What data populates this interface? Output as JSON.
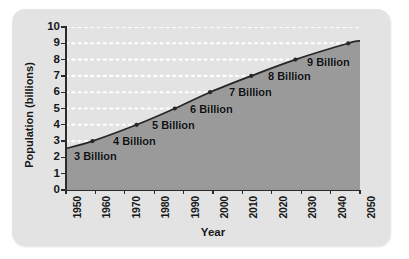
{
  "chart_data": {
    "type": "area",
    "title": "",
    "subtitle": "",
    "xlabel": "Year",
    "ylabel": "Population (billions)",
    "xlim": [
      1950,
      2050
    ],
    "ylim": [
      0,
      10
    ],
    "grid": "horizontal-dotted-white",
    "legend": "none",
    "x_tick_labels": [
      "1950",
      "1960",
      "1970",
      "1980",
      "1990",
      "2000",
      "2010",
      "2020",
      "2030",
      "2040",
      "2050"
    ],
    "x_ticks": [
      1950,
      1960,
      1970,
      1980,
      1990,
      2000,
      2010,
      2020,
      2030,
      2040,
      2050
    ],
    "y_tick_labels": [
      "0",
      "1",
      "2",
      "3",
      "4",
      "5",
      "6",
      "7",
      "8",
      "9",
      "10"
    ],
    "y_ticks": [
      0,
      1,
      2,
      3,
      4,
      5,
      6,
      7,
      8,
      9,
      10
    ],
    "series": [
      {
        "name": "World population",
        "x": [
          1950,
          1959,
          1974,
          1987,
          1999,
          2013,
          2028,
          2046,
          2050
        ],
        "values": [
          2.55,
          3,
          4,
          5,
          6,
          7,
          8,
          9,
          9.15
        ],
        "line_color": "#262626",
        "fill_color": "#9a9a9a"
      }
    ],
    "markers": [
      {
        "x": 1959,
        "y": 3,
        "label": "3 Billion"
      },
      {
        "x": 1974,
        "y": 4,
        "label": "4 Billion"
      },
      {
        "x": 1987,
        "y": 5,
        "label": "5 Billion"
      },
      {
        "x": 1999,
        "y": 6,
        "label": "6 Billion"
      },
      {
        "x": 2013,
        "y": 7,
        "label": "7 Billion"
      },
      {
        "x": 2028,
        "y": 8,
        "label": "8 Billion"
      },
      {
        "x": 2046,
        "y": 9,
        "label": "9 Billion"
      }
    ],
    "annotations": [
      {
        "text": "3 Billion",
        "x_px": 74,
        "y_px": 150
      },
      {
        "text": "4 Billion",
        "x_px": 113,
        "y_px": 135
      },
      {
        "text": "5 Billion",
        "x_px": 152,
        "y_px": 119
      },
      {
        "text": "6 Billion",
        "x_px": 190,
        "y_px": 103
      },
      {
        "text": "7 Billion",
        "x_px": 229,
        "y_px": 86
      },
      {
        "text": "8 Billion",
        "x_px": 268,
        "y_px": 70
      },
      {
        "text": "9 Billion",
        "x_px": 307,
        "y_px": 56
      }
    ],
    "colors": {
      "card_background": "#e3e3e3",
      "plot_background": "#e3e3e3",
      "area_fill": "#9a9a9a",
      "line": "#262626",
      "gridline": "#ffffff",
      "axis": "#2b2b2b",
      "text": "#16181a",
      "page_background": "#ffffff"
    }
  }
}
